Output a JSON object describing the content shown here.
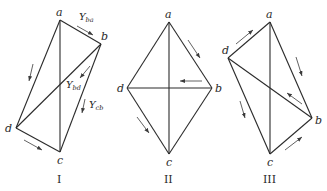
{
  "figure": {
    "stroke_color": "#2b2b2b",
    "background": "#ffffff",
    "diagrams": [
      {
        "id": "I",
        "caption": "I",
        "vertices": {
          "a": {
            "label": "a",
            "x": 60,
            "y": 20
          },
          "b": {
            "label": "b",
            "x": 101,
            "y": 44
          },
          "c": {
            "label": "c",
            "x": 60,
            "y": 152
          },
          "d": {
            "label": "d",
            "x": 16,
            "y": 128
          }
        },
        "edges": [
          "a-b",
          "b-c",
          "c-d",
          "d-a",
          "a-c",
          "b-d"
        ],
        "flow_labels": [
          {
            "main": "Y",
            "sub": "ba",
            "edge": "a-b"
          },
          {
            "main": "Y",
            "sub": "bd",
            "edge": "b-d"
          },
          {
            "main": "Y",
            "sub": "cb",
            "edge": "b-c"
          }
        ],
        "arrows": [
          "a→b",
          "a→d",
          "b→d",
          "b→c",
          "d→c"
        ]
      },
      {
        "id": "II",
        "caption": "II",
        "vertices": {
          "a": {
            "label": "a",
            "x": 169,
            "y": 22
          },
          "b": {
            "label": "b",
            "x": 212,
            "y": 88
          },
          "c": {
            "label": "c",
            "x": 169,
            "y": 154
          },
          "d": {
            "label": "d",
            "x": 127,
            "y": 88
          }
        },
        "edges": [
          "a-b",
          "b-c",
          "c-d",
          "d-a",
          "a-c",
          "b-d"
        ],
        "arrows": [
          "a→b",
          "b→d",
          "d→c"
        ]
      },
      {
        "id": "III",
        "caption": "III",
        "vertices": {
          "a": {
            "label": "a",
            "x": 270,
            "y": 22
          },
          "b": {
            "label": "b",
            "x": 312,
            "y": 118
          },
          "c": {
            "label": "c",
            "x": 270,
            "y": 154
          },
          "d": {
            "label": "d",
            "x": 228,
            "y": 58
          }
        },
        "edges": [
          "a-b",
          "b-c",
          "c-d",
          "d-a",
          "a-c",
          "b-d"
        ],
        "arrows": [
          "d→a",
          "a→b",
          "b→d",
          "d→c",
          "c→b"
        ]
      }
    ]
  }
}
